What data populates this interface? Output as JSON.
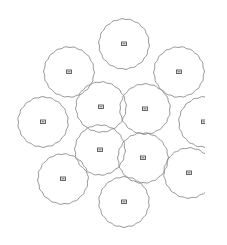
{
  "diagram": {
    "type": "coverage-circles",
    "background": "#ffffff",
    "stroke_color": "#8a8a8a",
    "icon_color": "#555555",
    "radius": 25,
    "clip_right": 205,
    "nodes": [
      {
        "id": 1,
        "cx": 124,
        "cy": 44
      },
      {
        "id": 2,
        "cx": 69,
        "cy": 72
      },
      {
        "id": 3,
        "cx": 179,
        "cy": 72
      },
      {
        "id": 4,
        "cx": 101,
        "cy": 107
      },
      {
        "id": 5,
        "cx": 145,
        "cy": 109
      },
      {
        "id": 6,
        "cx": 43,
        "cy": 122
      },
      {
        "id": 7,
        "cx": 204,
        "cy": 122
      },
      {
        "id": 8,
        "cx": 100,
        "cy": 150
      },
      {
        "id": 9,
        "cx": 143,
        "cy": 158
      },
      {
        "id": 10,
        "cx": 63,
        "cy": 179
      },
      {
        "id": 11,
        "cx": 189,
        "cy": 173
      },
      {
        "id": 12,
        "cx": 124,
        "cy": 202
      }
    ]
  }
}
